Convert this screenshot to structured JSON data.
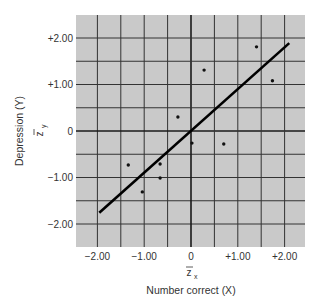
{
  "chart_data": {
    "type": "scatter",
    "title": "",
    "xlabel": "Number correct (X)",
    "ylabel": "Depression (Y)",
    "x_z_label": "z",
    "x_z_sub": "x",
    "y_z_label": "z",
    "y_z_sub": "y",
    "xlim": [
      -2.5,
      2.4
    ],
    "ylim": [
      -2.5,
      2.5
    ],
    "grid": true,
    "x_ticks": [
      {
        "value": -2,
        "label": "−2.00"
      },
      {
        "value": -1,
        "label": "−1.00"
      },
      {
        "value": 0,
        "label": "0"
      },
      {
        "value": 1,
        "label": "+1.00"
      },
      {
        "value": 2,
        "label": "+2.00"
      }
    ],
    "y_ticks": [
      {
        "value": 2,
        "label": "+2.00"
      },
      {
        "value": 1,
        "label": "+1.00"
      },
      {
        "value": 0,
        "label": "0"
      },
      {
        "value": -1,
        "label": "−1.00"
      },
      {
        "value": -2,
        "label": "−2.00"
      }
    ],
    "points": [
      {
        "x": -1.34,
        "y": -0.73
      },
      {
        "x": -1.04,
        "y": -1.31
      },
      {
        "x": -0.66,
        "y": -0.71
      },
      {
        "x": -0.66,
        "y": -1.01
      },
      {
        "x": -0.28,
        "y": 0.3
      },
      {
        "x": 0.02,
        "y": -0.26
      },
      {
        "x": 0.28,
        "y": 1.31
      },
      {
        "x": 0.7,
        "y": -0.28
      },
      {
        "x": 1.4,
        "y": 1.81
      },
      {
        "x": 1.74,
        "y": 1.08
      }
    ],
    "regression_line": {
      "x1": -1.96,
      "y1": -1.76,
      "x2": 2.1,
      "y2": 1.89
    },
    "colors": {
      "plot_background": "#c9c9c9",
      "grid_major": "#1a1a1a",
      "grid_minor": "#333333",
      "points": "#111111",
      "line": "#000000",
      "text": "#333333"
    }
  }
}
